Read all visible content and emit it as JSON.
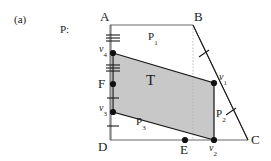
{
  "figure": {
    "panel_label": "(a)",
    "polygon_label": "P:",
    "colors": {
      "shaded_fill": "#c8c8c8",
      "outline": "#1a1a1a",
      "thin_outline": "#555555",
      "dotted_guide": "#aaaaaa",
      "text": "#1a1a1a"
    },
    "vertices": [
      {
        "name": "A",
        "label": "A",
        "x": 110,
        "y": 25,
        "dot": false,
        "label_dx": -12,
        "label_dy": -17
      },
      {
        "name": "B",
        "label": "B",
        "x": 193,
        "y": 25,
        "dot": false,
        "label_dx": 3,
        "label_dy": -17
      },
      {
        "name": "C",
        "label": "C",
        "x": 248,
        "y": 140,
        "dot": false,
        "label_dx": 4,
        "label_dy": -6
      },
      {
        "name": "D",
        "label": "D",
        "x": 110,
        "y": 140,
        "dot": false,
        "label_dx": -12,
        "label_dy": 1
      },
      {
        "name": "E",
        "label": "E",
        "x": 185,
        "y": 140,
        "dot": true,
        "label_dx": -4,
        "label_dy": 3
      },
      {
        "name": "F",
        "label": "F",
        "x": 113,
        "y": 84,
        "dot": true,
        "label_dx": -14,
        "label_dy": -7
      }
    ],
    "trapezoid_vertices": [
      {
        "name": "v4",
        "label": "v",
        "subscript": "4",
        "x": 113,
        "y": 53,
        "dot": true,
        "label_dx": -15,
        "label_dy": -10
      },
      {
        "name": "v1",
        "label": "v",
        "subscript": "1",
        "x": 214,
        "y": 83,
        "dot": true,
        "label_dx": 4,
        "label_dy": -11
      },
      {
        "name": "v2",
        "label": "v",
        "subscript": "2",
        "x": 214,
        "y": 140,
        "dot": true,
        "label_dx": -3,
        "label_dy": 2
      },
      {
        "name": "v3",
        "label": "v",
        "subscript": "3",
        "x": 113,
        "y": 112,
        "dot": true,
        "label_dx": -15,
        "label_dy": -10
      }
    ],
    "region_labels": [
      {
        "name": "P1",
        "label": "P",
        "subscript": "1",
        "x": 152,
        "y": 38
      },
      {
        "name": "P2",
        "label": "P",
        "subscript": "2",
        "x": 220,
        "y": 115
      },
      {
        "name": "P3",
        "label": "P",
        "subscript": "3",
        "x": 140,
        "y": 122
      },
      {
        "name": "T",
        "label": "T",
        "subscript": "",
        "x": 150,
        "y": 82
      }
    ],
    "tick_marks": [
      {
        "name": "tick-A-v4",
        "x": 113,
        "y": 38,
        "count": 3,
        "angle": 0
      },
      {
        "name": "tick-v4-F",
        "x": 113,
        "y": 68,
        "count": 3,
        "angle": 0
      },
      {
        "name": "tick-F-v3",
        "x": 113,
        "y": 98,
        "count": 1,
        "angle": 0
      },
      {
        "name": "tick-v3-D",
        "x": 113,
        "y": 126,
        "count": 1,
        "angle": 0
      },
      {
        "name": "tick-B-v1",
        "x": 204,
        "y": 54,
        "count": 1,
        "angle": 60
      },
      {
        "name": "tick-v1-C",
        "x": 231,
        "y": 112,
        "count": 1,
        "angle": 60
      }
    ],
    "guide_line": {
      "name": "dotted-guide-B-E",
      "x1": 193,
      "y1": 25,
      "x2": 193,
      "y2": 140
    }
  }
}
